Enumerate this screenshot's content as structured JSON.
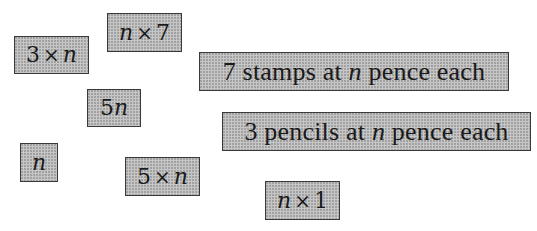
{
  "cards": [
    {
      "id": "3xn",
      "parts": {
        "a": "3",
        "op": "×",
        "b": "n"
      }
    },
    {
      "id": "nx7",
      "parts": {
        "a": "n",
        "op": "×",
        "b": "7"
      }
    },
    {
      "id": "stamps",
      "text_before": "7 stamps at ",
      "var": "n",
      "text_after": " pence each"
    },
    {
      "id": "5n",
      "parts": {
        "a": "5",
        "b": "n"
      }
    },
    {
      "id": "pencils",
      "text_before": "3 pencils at ",
      "var": "n",
      "text_after": " pence each"
    },
    {
      "id": "n",
      "parts": {
        "a": "n"
      }
    },
    {
      "id": "5xn",
      "parts": {
        "a": "5",
        "op": "×",
        "b": "n"
      }
    },
    {
      "id": "nx1",
      "parts": {
        "a": "n",
        "op": "×",
        "b": "1"
      }
    }
  ],
  "colors": {
    "card_fill": "#c6c6c6",
    "card_border": "#3a3a3a",
    "text": "#1a1a1a"
  }
}
